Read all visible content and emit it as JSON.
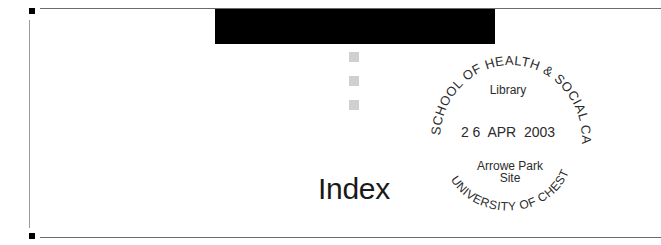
{
  "page": {
    "section_title": "Index",
    "colors": {
      "band": "#000000",
      "squares": "#d0d0d0",
      "rules": "#6a6a6a",
      "text": "#1a1a1a"
    }
  },
  "stamp": {
    "top_arc": "SCHOOL OF HEALTH & SOCIAL CARE",
    "bottom_arc": "UNIVERSITY OF CHESTER",
    "library_label": "Library",
    "date": "2 6  APR  2003",
    "site_line1": "Arrowe Park",
    "site_line2": "Site"
  }
}
